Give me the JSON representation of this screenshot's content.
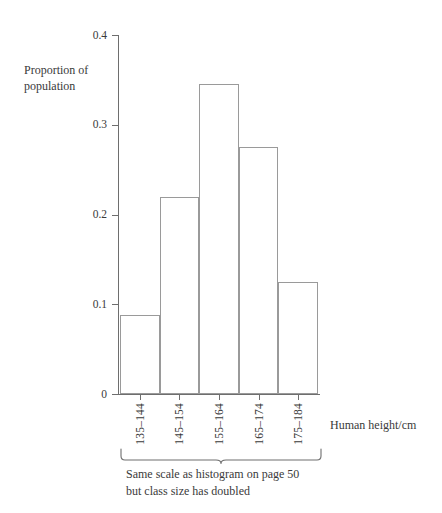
{
  "chart_data": {
    "type": "bar",
    "title": "",
    "subtitle": "",
    "xlabel": "Human height/cm",
    "ylabel": "Proportion of population",
    "categories": [
      "135–144",
      "145–154",
      "155–164",
      "165–174",
      "175–184"
    ],
    "values": [
      0.088,
      0.22,
      0.345,
      0.275,
      0.125
    ],
    "ylim": [
      0,
      0.4
    ],
    "yticks": [
      0,
      0.1,
      0.2,
      0.3,
      0.4
    ],
    "ytick_labels": [
      "0",
      "0.1",
      "0.2",
      "0.3",
      "0.4"
    ],
    "grid": false,
    "legend": null,
    "bar_style": {
      "fill": "#ffffff",
      "stroke": "#9a9a9a",
      "gap": 0,
      "note": "adjacent histogram bars, no spacing"
    },
    "annotations": [
      {
        "type": "brace",
        "spans_categories": [
          "135–144",
          "175–184"
        ],
        "text_line_1": "Same scale as histogram on page 50",
        "text_line_2": "but class size has doubled"
      }
    ]
  },
  "axis": {
    "y_title_line_1": "Proportion of",
    "y_title_line_2": "population",
    "x_title": "Human height/cm"
  },
  "caption": {
    "line_1": "Same scale as histogram on page 50",
    "line_2": "but class size has doubled"
  },
  "colors": {
    "axis": "#6e6e6e",
    "bar_stroke": "#9a9a9a",
    "bar_fill": "#ffffff",
    "text": "#3a3a3a",
    "background": "#ffffff"
  }
}
